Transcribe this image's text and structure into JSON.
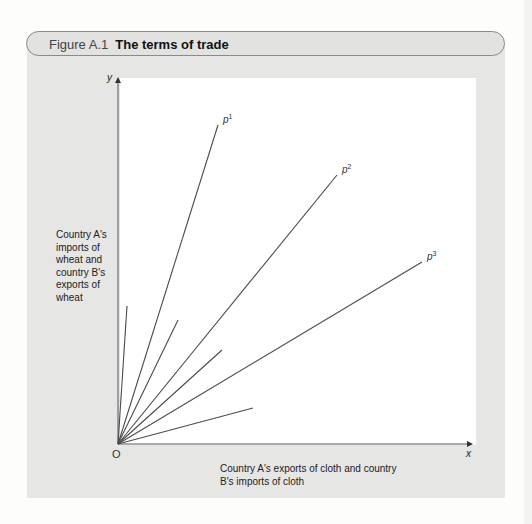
{
  "figure": {
    "number": "Figure A.1",
    "title": "The terms of trade"
  },
  "axes": {
    "y_letter": "y",
    "x_letter": "x",
    "origin_label": "O",
    "y_label": "Country A's imports of wheat and country B's exports of wheat",
    "x_label": "Country A's exports of cloth and country B's imports of cloth"
  },
  "chart_data": {
    "type": "line",
    "title": "The terms of trade",
    "xlabel": "Country A's exports of cloth and country B's imports of cloth",
    "ylabel": "Country A's imports of wheat and country B's exports of wheat",
    "origin": "O",
    "grid": false,
    "legend": "none",
    "series": [
      {
        "name": "p1",
        "label": "p",
        "sup": "1",
        "from": [
          0,
          0
        ],
        "to": [
          100,
          319
        ],
        "labeled": true
      },
      {
        "name": "p2",
        "label": "p",
        "sup": "2",
        "from": [
          0,
          0
        ],
        "to": [
          219,
          269
        ],
        "labeled": true
      },
      {
        "name": "p3",
        "label": "p",
        "sup": "3",
        "from": [
          0,
          0
        ],
        "to": [
          304,
          182
        ],
        "labeled": true
      },
      {
        "name": "ray-a",
        "from": [
          0,
          0
        ],
        "to": [
          9,
          138
        ],
        "labeled": false
      },
      {
        "name": "ray-b",
        "from": [
          0,
          0
        ],
        "to": [
          60,
          124
        ],
        "labeled": false
      },
      {
        "name": "ray-c",
        "from": [
          0,
          0
        ],
        "to": [
          104,
          94
        ],
        "labeled": false
      },
      {
        "name": "ray-d",
        "from": [
          0,
          0
        ],
        "to": [
          135,
          36
        ],
        "labeled": false
      }
    ]
  },
  "colors": {
    "panel": "#e6e6e5",
    "line": "#4a4a4a",
    "axis": "#555555"
  }
}
